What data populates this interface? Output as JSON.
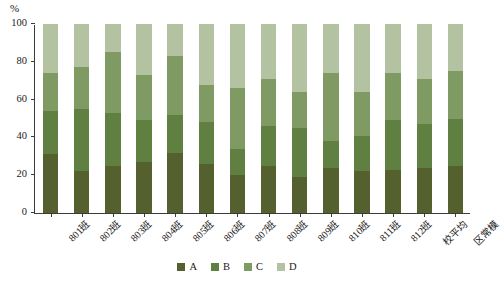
{
  "chart_data": {
    "type": "bar",
    "stacked": true,
    "title": "",
    "subtitle": "",
    "xlabel": "",
    "ylabel": "%",
    "ylim": [
      0,
      100
    ],
    "yticks": [
      0,
      20,
      40,
      60,
      80,
      100
    ],
    "ytick_labels": [
      "0",
      "20",
      "40",
      "60",
      "80",
      "100"
    ],
    "grid": false,
    "legend_position": "bottom-center",
    "categories": [
      "801班",
      "802班",
      "803班",
      "804班",
      "805班",
      "806班",
      "807班",
      "808班",
      "809班",
      "810班",
      "811班",
      "812班",
      "校平均",
      "区常模"
    ],
    "series": [
      {
        "name": "A",
        "color": "#55602f",
        "values": [
          31,
          22,
          25,
          27,
          32,
          26,
          20,
          25,
          19,
          24,
          22,
          23,
          24,
          25
        ]
      },
      {
        "name": "B",
        "color": "#5f8040",
        "values": [
          23,
          33,
          28,
          22,
          20,
          22,
          14,
          21,
          26,
          14,
          19,
          26,
          23,
          25
        ]
      },
      {
        "name": "C",
        "color": "#7f9a63",
        "values": [
          20,
          22,
          32,
          24,
          31,
          20,
          32,
          25,
          19,
          36,
          23,
          25,
          24,
          25
        ]
      },
      {
        "name": "D",
        "color": "#b3c3a2",
        "values": [
          26,
          23,
          15,
          27,
          17,
          32,
          34,
          29,
          36,
          26,
          36,
          26,
          29,
          25
        ]
      }
    ],
    "legend": [
      {
        "label": "A",
        "color": "#55602f"
      },
      {
        "label": "B",
        "color": "#5f8040"
      },
      {
        "label": "C",
        "color": "#7f9a63"
      },
      {
        "label": "D",
        "color": "#b3c3a2"
      }
    ],
    "axis_color": "#3b3b3b",
    "background_color": "#ffffff"
  }
}
